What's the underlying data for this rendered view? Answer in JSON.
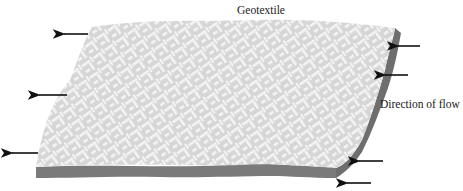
{
  "title": "Geotextile",
  "flow_label": "Direction of flow",
  "colors": {
    "weave_bg": "#d6d6d6",
    "weave_thread": "#f4f4f4",
    "thickness_edge": "#7a7a7a",
    "side_edge": "#6e6e6e",
    "arrow": "#111111"
  },
  "arrows": {
    "left": [
      {
        "x1": 88,
        "y1": 34,
        "x2": 63,
        "y2": 34,
        "direction": "left"
      },
      {
        "x1": 67,
        "y1": 95,
        "x2": 38,
        "y2": 95,
        "direction": "left"
      },
      {
        "x1": 38,
        "y1": 153,
        "x2": 11,
        "y2": 153,
        "direction": "left"
      }
    ],
    "right": [
      {
        "x1": 420,
        "y1": 46,
        "x2": 397,
        "y2": 46,
        "direction": "left"
      },
      {
        "x1": 408,
        "y1": 75,
        "x2": 384,
        "y2": 75,
        "direction": "left"
      },
      {
        "x1": 383,
        "y1": 161,
        "x2": 358,
        "y2": 161,
        "direction": "left"
      },
      {
        "x1": 371,
        "y1": 183,
        "x2": 346,
        "y2": 183,
        "direction": "left"
      }
    ]
  }
}
